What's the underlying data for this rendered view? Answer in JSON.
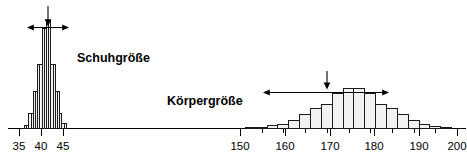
{
  "figure": {
    "width": 467,
    "height": 164,
    "background": "#ffffff",
    "baseline_y": 128,
    "axis_color": "#000000",
    "bar_fill": "#f2f2f2",
    "bar_stroke": "#1a1a1a"
  },
  "chart_data": [
    {
      "type": "bar",
      "name": "Schuhgroesse",
      "title": "Schuhgröße",
      "xlabel": "",
      "ylabel": "",
      "grid": false,
      "legend": "none",
      "xlim": [
        33,
        48
      ],
      "ylim": [
        0,
        100
      ],
      "tick_labels": [
        "35",
        "40",
        "45"
      ],
      "tick_values": [
        35,
        40,
        45
      ],
      "bin_width": 0.5,
      "categories": [
        36.5,
        37,
        37.5,
        38,
        38.5,
        39,
        39.5,
        40,
        40.5,
        41,
        41.5,
        42,
        42.5,
        43,
        43.5,
        44,
        44.5,
        45,
        45.5
      ],
      "values": [
        3,
        3,
        14,
        14,
        34,
        34,
        59,
        59,
        93,
        93,
        100,
        100,
        59,
        59,
        34,
        34,
        14,
        5,
        5
      ],
      "annotations": [
        {
          "kind": "mean-arrow",
          "label": "",
          "x": 41.1,
          "direction": "down"
        },
        {
          "kind": "spread-arrow",
          "label": "",
          "x_from": 39.3,
          "x_to": 42.8,
          "direction": "both"
        }
      ]
    },
    {
      "type": "bar",
      "name": "Koerpergroesse",
      "title": "Körpergröße",
      "xlabel": "",
      "ylabel": "",
      "grid": false,
      "legend": "none",
      "xlim": [
        148,
        202
      ],
      "ylim": [
        0,
        100
      ],
      "tick_labels": [
        "150",
        "160",
        "170",
        "180",
        "190",
        "200"
      ],
      "tick_values": [
        150,
        160,
        170,
        180,
        190,
        200
      ],
      "bin_width": 2.5,
      "categories": [
        152.5,
        155,
        157.5,
        160,
        162.5,
        165,
        167.5,
        170,
        172.5,
        175,
        177.5,
        180,
        182.5,
        185,
        187.5,
        190,
        192.5,
        195,
        197.5
      ],
      "values": [
        2,
        3,
        6,
        9,
        18,
        30,
        42,
        52,
        74,
        85,
        85,
        74,
        52,
        42,
        30,
        18,
        9,
        5,
        3
      ],
      "annotations": [
        {
          "kind": "mean-arrow",
          "label": "",
          "x": 175.2,
          "direction": "down"
        },
        {
          "kind": "spread-arrow",
          "label": "",
          "x_from": 161.5,
          "x_to": 188.5,
          "direction": "both"
        }
      ]
    }
  ],
  "labels": {
    "left_series": "Schuhgröße",
    "right_series": "Körpergröße"
  },
  "axis_ticks": {
    "left": [
      {
        "label": "35",
        "x": 19
      },
      {
        "label": "40",
        "x": 41
      },
      {
        "label": "45",
        "x": 63
      }
    ],
    "right": [
      {
        "label": "150",
        "x": 240
      },
      {
        "label": "160",
        "x": 285
      },
      {
        "label": "170",
        "x": 330
      },
      {
        "label": "180",
        "x": 374
      },
      {
        "label": "190",
        "x": 419
      },
      {
        "label": "200",
        "x": 457
      }
    ]
  }
}
